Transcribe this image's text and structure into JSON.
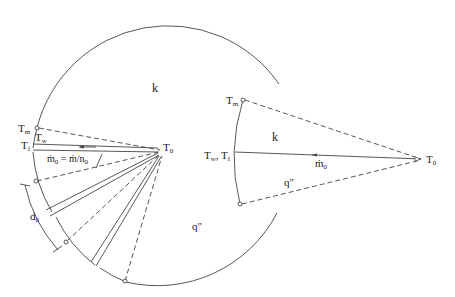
{
  "figure": {
    "left_panel": {
      "labels": {
        "k": "k",
        "q": "q\"",
        "T_m": "T",
        "T_m_sub": "m",
        "T_w": "T",
        "T_w_sub": "w",
        "T_f": "T",
        "T_f_sub": "f",
        "T_0": "T",
        "T_0_sub": "0",
        "mdot0_eq": "ṁ",
        "mdot0_eq_sub": "0",
        "mdot0_eq_rhs": " = ṁ/n",
        "mdot0_eq_rhs_sub": "0",
        "d0": "d",
        "d0_sub": "0"
      }
    },
    "right_panel": {
      "labels": {
        "k": "k",
        "q": "q\"",
        "T_m": "T",
        "T_m_sub": "m",
        "T_wf": "T",
        "T_wf_sub1": "w",
        "T_wf_sep": ", T",
        "T_wf_sub2": "f",
        "T_0": "T",
        "T_0_sub": "0",
        "mdot0": "ṁ",
        "mdot0_sub": "0"
      }
    },
    "colors": {
      "line": "#444444",
      "text": "#222222",
      "background": "#ffffff"
    }
  }
}
